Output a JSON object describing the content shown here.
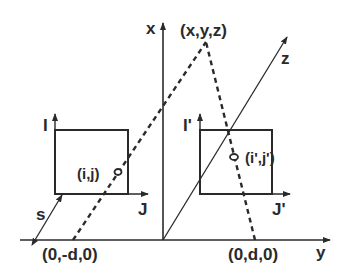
{
  "diagram": {
    "colors": {
      "ink": "#2a2a2a",
      "background": "#ffffff"
    },
    "axes": {
      "x_label": "x",
      "y_label": "y",
      "z_label": "z"
    },
    "points": {
      "world_point": "(x,y,z)",
      "left_center": "(0,-d,0)",
      "right_center": "(0,d,0)",
      "left_image_point": "(i,j)",
      "right_image_point": "(i',j')"
    },
    "left_image": {
      "row_axis": "I",
      "col_axis": "J"
    },
    "right_image": {
      "row_axis": "I'",
      "col_axis": "J'"
    },
    "distance_label": "s"
  }
}
